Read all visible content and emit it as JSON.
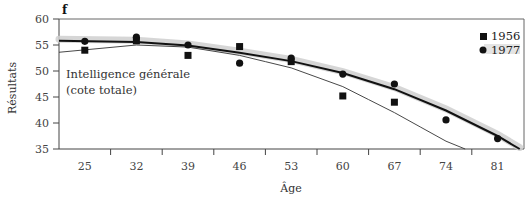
{
  "panel_label": "f",
  "annotation_line1": "Intelligence générale",
  "annotation_line2": "(cote totale)",
  "chart_data": {
    "type": "scatter",
    "title": "Intelligence générale (cote totale)",
    "xlabel": "Âge",
    "ylabel": "Résultats",
    "categories": [
      25,
      32,
      39,
      46,
      53,
      60,
      67,
      74,
      81
    ],
    "ylim": [
      35,
      60
    ],
    "yticks": [
      35,
      40,
      45,
      50,
      55,
      60
    ],
    "xticks": [
      "25",
      "32",
      "39",
      "46",
      "53",
      "60",
      "67",
      "74",
      "81"
    ],
    "grid": false,
    "legend_position": "top-right",
    "series": [
      {
        "name": "1956",
        "marker": "square",
        "x": [
          25,
          32,
          39,
          46,
          53,
          60,
          67
        ],
        "values": [
          54.0,
          55.8,
          53.0,
          54.7,
          51.8,
          45.2,
          44.0
        ],
        "fit_curve": [
          [
            21.5,
            53.6
          ],
          [
            32,
            55.0
          ],
          [
            39,
            54.6
          ],
          [
            46,
            53.0
          ],
          [
            53,
            50.6
          ],
          [
            60,
            47.0
          ],
          [
            67,
            42.0
          ],
          [
            74,
            36.5
          ],
          [
            76.6,
            35.0
          ]
        ]
      },
      {
        "name": "1977",
        "marker": "circle",
        "x": [
          25,
          32,
          39,
          46,
          53,
          60,
          67,
          74,
          81
        ],
        "values": [
          55.7,
          56.5,
          55.0,
          51.5,
          52.5,
          49.4,
          47.5,
          40.6,
          37.0
        ],
        "fit_curve": [
          [
            21.5,
            55.8
          ],
          [
            32,
            55.6
          ],
          [
            39,
            54.9
          ],
          [
            46,
            53.5
          ],
          [
            53,
            51.9
          ],
          [
            60,
            49.6
          ],
          [
            67,
            46.5
          ],
          [
            74,
            42.4
          ],
          [
            81,
            37.5
          ],
          [
            84,
            35.0
          ]
        ]
      }
    ]
  }
}
